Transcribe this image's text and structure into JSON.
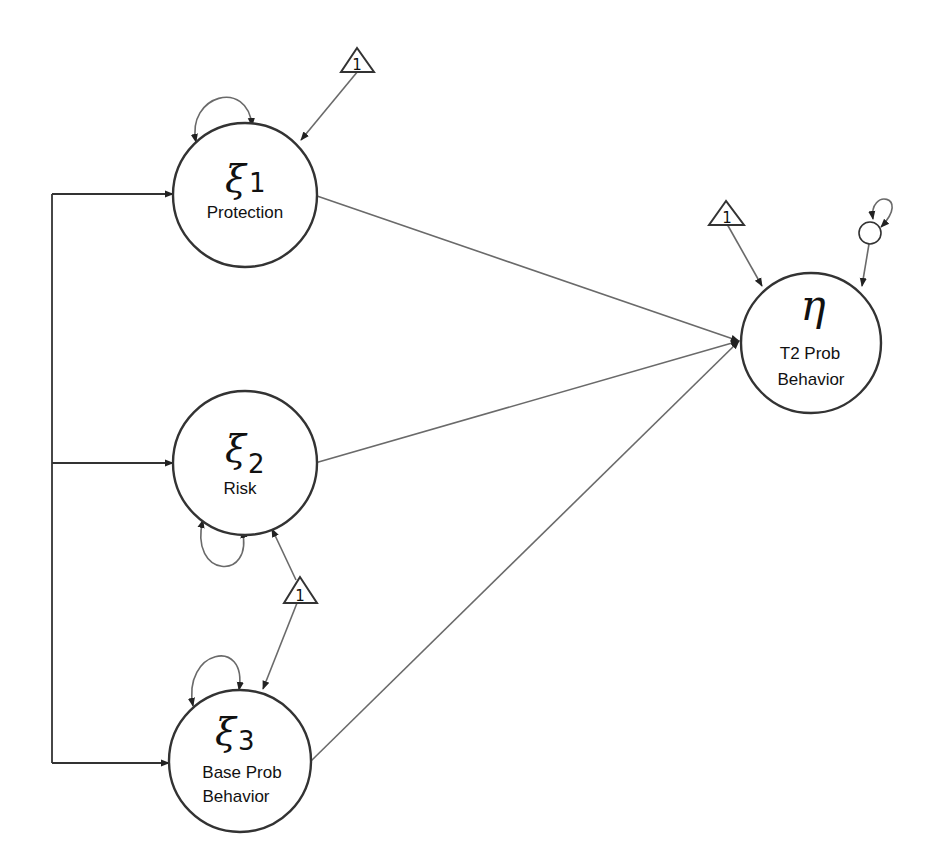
{
  "diagram": {
    "type": "structural-equation-model path diagram",
    "nodes": [
      {
        "id": "xi1",
        "symbol": "ξ",
        "subscript": "1",
        "label_line1": "Protection",
        "label_line2": ""
      },
      {
        "id": "xi2",
        "symbol": "ξ",
        "subscript": "2",
        "label_line1": "Risk",
        "label_line2": ""
      },
      {
        "id": "xi3",
        "symbol": "ξ",
        "subscript": "3",
        "label_line1": "Base Prob",
        "label_line2": "Behavior"
      },
      {
        "id": "eta",
        "symbol": "η",
        "subscript": "",
        "label_line1": "T2 Prob",
        "label_line2": "Behavior"
      }
    ],
    "constants": [
      {
        "id": "const-xi1",
        "label": "1"
      },
      {
        "id": "const-xi2-xi3",
        "label": "1"
      },
      {
        "id": "const-eta",
        "label": "1"
      }
    ],
    "disturbance": {
      "id": "eta-disturbance"
    },
    "edges": [
      {
        "from": "xi1",
        "to": "eta",
        "type": "regression"
      },
      {
        "from": "xi2",
        "to": "eta",
        "type": "regression"
      },
      {
        "from": "xi3",
        "to": "eta",
        "type": "regression"
      },
      {
        "from": "xi1",
        "to": "xi2",
        "type": "covariance-bracket"
      },
      {
        "from": "xi1",
        "to": "xi3",
        "type": "covariance-bracket"
      },
      {
        "from": "const-xi1",
        "to": "xi1",
        "type": "mean"
      },
      {
        "from": "const-xi2-xi3",
        "to": "xi2",
        "type": "mean"
      },
      {
        "from": "const-xi2-xi3",
        "to": "xi3",
        "type": "mean"
      },
      {
        "from": "const-eta",
        "to": "eta",
        "type": "intercept"
      },
      {
        "from": "eta-disturbance",
        "to": "eta",
        "type": "residual"
      }
    ]
  }
}
